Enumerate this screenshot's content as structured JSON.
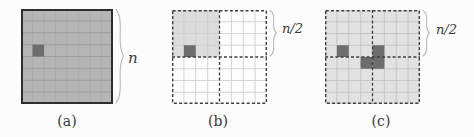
{
  "figure": {
    "background": "#fcfcfc",
    "colors": {
      "dark_cell": "#6d6d6d",
      "dashed_line": "#3e3e3e",
      "solid_border": "#2d2d2d",
      "brace": "#b9b9b9",
      "text": "#3a3a3a"
    },
    "panels": [
      {
        "caption": "(a)",
        "brace_label": "n",
        "border": "solid",
        "fill": "#b5b5b5",
        "grid_line_color": "#989898",
        "vline_color": "#a9a9a9",
        "grid": {
          "rows": 8,
          "cols": 8
        },
        "midlines": false,
        "shaded_regions": [],
        "dark_cells": [
          {
            "row": 4,
            "col": 2
          }
        ]
      },
      {
        "caption": "(b)",
        "brace_label": "n/2",
        "border": "dashed",
        "fill": "#fdfdfd",
        "grid_line_color": "#cbcbcb",
        "grid": {
          "rows": 8,
          "cols": 8
        },
        "midlines": true,
        "shaded_regions": [
          {
            "row0": 1,
            "col0": 1,
            "row1": 4,
            "col1": 4,
            "color": "#dcdcdc"
          }
        ],
        "dark_cells": [
          {
            "row": 4,
            "col": 2
          }
        ]
      },
      {
        "caption": "(c)",
        "brace_label": "n/2",
        "border": "dashed",
        "fill": "#e2e2e2",
        "grid_line_color": "#c0c0c0",
        "grid": {
          "rows": 8,
          "cols": 8
        },
        "midlines": true,
        "shaded_regions": [],
        "dark_cells": [
          {
            "row": 4,
            "col": 2
          },
          {
            "row": 4,
            "col": 5
          },
          {
            "row": 5,
            "col": 4
          },
          {
            "row": 5,
            "col": 5
          }
        ]
      }
    ]
  }
}
